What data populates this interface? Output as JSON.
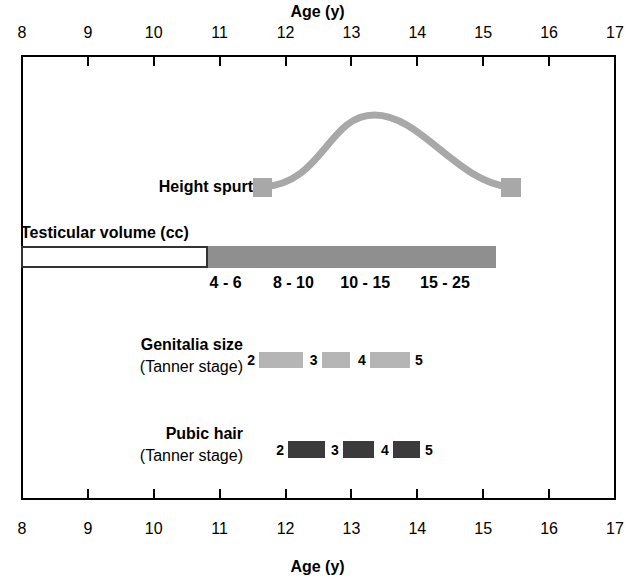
{
  "chart_data": {
    "type": "timeline",
    "xlabel": "Age (y)",
    "xlim": [
      8,
      17
    ],
    "xticks": [
      8,
      9,
      10,
      11,
      12,
      13,
      14,
      15,
      16,
      17
    ],
    "grid": false,
    "legend": "none",
    "axis_title_top": "Age (y)",
    "axis_title_bottom": "Age (y)",
    "colors": {
      "height_spurt": "#a8a8a8",
      "testicular_gray": "#8f8f8f",
      "testicular_white": "#ffffff",
      "genitalia": "#b5b5b5",
      "pubic_hair": "#3b3b3b",
      "axis": "#000000"
    },
    "rows": [
      {
        "name": "height-spurt",
        "label": "Height spurt",
        "sublabel": "",
        "type": "curve",
        "start_age": 11.65,
        "peak_age": 13.35,
        "end_age": 15.4,
        "markers": [
          11.65,
          15.4
        ]
      },
      {
        "name": "testicular-volume",
        "label": "Testicular volume (cc)",
        "sublabel": "",
        "type": "bar",
        "prepubertal_start_age": 8.0,
        "prepubertal_end_age": 10.83,
        "pubertal_start_age": 10.83,
        "pubertal_end_age": 15.2,
        "segments": [
          {
            "label": "4 - 6",
            "center_age": 11.09
          },
          {
            "label": "8 - 10",
            "center_age": 12.12
          },
          {
            "label": "10 - 15",
            "center_age": 13.21
          },
          {
            "label": "15 - 25",
            "center_age": 14.42
          }
        ]
      },
      {
        "name": "genitalia-size",
        "label": "Genitalia size",
        "sublabel": "(Tanner stage)",
        "type": "stages",
        "stages": [
          {
            "start_label": "2",
            "end_label": "3",
            "start_age": 11.6,
            "end_age": 12.27
          },
          {
            "start_label": "3",
            "end_label": "4",
            "start_age": 12.55,
            "end_age": 12.98
          },
          {
            "start_label": "4",
            "end_label": "5",
            "start_age": 13.28,
            "end_age": 13.89
          }
        ]
      },
      {
        "name": "pubic-hair",
        "label": "Pubic hair",
        "sublabel": "(Tanner stage)",
        "type": "stages",
        "stages": [
          {
            "start_label": "2",
            "end_label": "3",
            "start_age": 12.04,
            "end_age": 12.6
          },
          {
            "start_label": "3",
            "end_label": "4",
            "start_age": 12.87,
            "end_age": 13.34
          },
          {
            "start_label": "4",
            "end_label": "5",
            "start_age": 13.63,
            "end_age": 14.04
          }
        ]
      }
    ]
  },
  "axis": {
    "title": "Age (y)",
    "ticks": [
      "8",
      "9",
      "10",
      "11",
      "12",
      "13",
      "14",
      "15",
      "16",
      "17"
    ]
  },
  "rows": {
    "height_spurt": {
      "label": "Height spurt"
    },
    "testicular_volume": {
      "label": "Testicular volume (cc)",
      "volumes": [
        "4 - 6",
        "8 - 10",
        "10 - 15",
        "15 - 25"
      ]
    },
    "genitalia": {
      "label": "Genitalia size",
      "sublabel": "(Tanner stage)",
      "numbers": [
        "2",
        "3",
        "4",
        "5"
      ]
    },
    "pubic_hair": {
      "label": "Pubic hair",
      "sublabel": "(Tanner stage)",
      "numbers": [
        "2",
        "3",
        "4",
        "5"
      ]
    }
  }
}
